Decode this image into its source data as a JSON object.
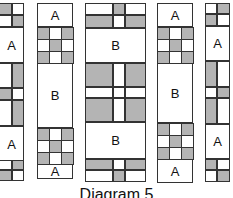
{
  "figure": {
    "caption": "Diagram 5",
    "shade_color": "#b4b4b4",
    "line_color": "#333333"
  },
  "strips": [
    {
      "name": "strip-1",
      "blocks": [
        "four-patch",
        "A",
        "two-patch",
        "A",
        "four-patch"
      ],
      "labels": [
        "A",
        "A"
      ]
    },
    {
      "name": "strip-2",
      "blocks": [
        "A",
        "nine-patch",
        "B",
        "nine-patch",
        "A"
      ],
      "labels": [
        "A",
        "B",
        "A"
      ]
    },
    {
      "name": "strip-3",
      "blocks": [
        "rail",
        "B",
        "rail",
        "B",
        "rail"
      ],
      "labels": [
        "B",
        "B"
      ]
    },
    {
      "name": "strip-4",
      "blocks": [
        "A",
        "nine-patch",
        "B",
        "nine-patch",
        "A"
      ],
      "labels": [
        "A",
        "B",
        "A"
      ]
    },
    {
      "name": "strip-5",
      "blocks": [
        "four-patch",
        "A",
        "two-patch",
        "A",
        "four-patch"
      ],
      "labels": [
        "A",
        "A"
      ]
    }
  ]
}
